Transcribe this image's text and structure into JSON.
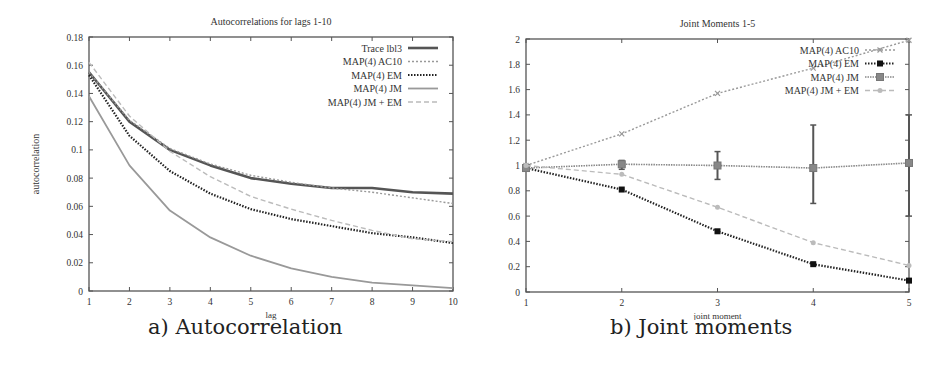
{
  "captions": {
    "left": "a) Autocorrelation",
    "right": "b) Joint moments"
  },
  "chart_data": [
    {
      "type": "line",
      "title": "Autocorrelations for lags 1-10",
      "xlabel": "lag",
      "ylabel": "autocorrelation",
      "x": [
        1,
        2,
        3,
        4,
        5,
        6,
        7,
        8,
        9,
        10
      ],
      "xlim": [
        1,
        10
      ],
      "ylim": [
        0,
        0.18
      ],
      "xticks": [
        1,
        2,
        3,
        4,
        5,
        6,
        7,
        8,
        9,
        10
      ],
      "yticks": [
        0,
        0.02,
        0.04,
        0.06,
        0.08,
        0.1,
        0.12,
        0.14,
        0.16,
        0.18
      ],
      "ytick_labels": [
        "0",
        "0.02",
        "0.04",
        "0.06",
        "0.08",
        "0.1",
        "0.12",
        "0.14",
        "0.16",
        "0.18"
      ],
      "grid": false,
      "legend_position": "top-right",
      "series": [
        {
          "name": "Trace lbl3",
          "values": [
            0.155,
            0.12,
            0.1,
            0.089,
            0.08,
            0.076,
            0.073,
            0.073,
            0.07,
            0.069
          ],
          "color": "#555555",
          "dash": "",
          "width": 2.6
        },
        {
          "name": "MAP(4) AC10",
          "values": [
            0.155,
            0.121,
            0.101,
            0.09,
            0.082,
            0.077,
            0.073,
            0.07,
            0.066,
            0.062
          ],
          "color": "#999999",
          "dash": "2,2",
          "width": 1.4
        },
        {
          "name": "MAP(4) EM",
          "values": [
            0.153,
            0.11,
            0.085,
            0.069,
            0.058,
            0.051,
            0.046,
            0.041,
            0.038,
            0.034
          ],
          "color": "#222222",
          "dash": "1.5,1.5",
          "width": 2.2
        },
        {
          "name": "MAP(4) JM",
          "values": [
            0.138,
            0.089,
            0.057,
            0.038,
            0.025,
            0.016,
            0.01,
            0.006,
            0.004,
            0.002
          ],
          "color": "#999999",
          "dash": "",
          "width": 1.8
        },
        {
          "name": "MAP(4) JM + EM",
          "values": [
            0.162,
            0.124,
            0.099,
            0.081,
            0.067,
            0.058,
            0.05,
            0.043,
            0.037,
            0.035
          ],
          "color": "#bbbbbb",
          "dash": "5,3",
          "width": 1.4
        }
      ]
    },
    {
      "type": "line",
      "title": "Joint Moments 1-5",
      "xlabel": "joint moment",
      "ylabel": "",
      "x": [
        1,
        2,
        3,
        4,
        5
      ],
      "xlim": [
        1,
        5
      ],
      "ylim": [
        0,
        2
      ],
      "xticks": [
        1,
        2,
        3,
        4,
        5
      ],
      "yticks": [
        0,
        0.2,
        0.4,
        0.6,
        0.8,
        1,
        1.2,
        1.4,
        1.6,
        1.8,
        2
      ],
      "ytick_labels": [
        "0",
        "0.2",
        "0.4",
        "0.6",
        "0.8",
        "1",
        "1.2",
        "1.4",
        "1.6",
        "1.8",
        "2"
      ],
      "grid": false,
      "legend_position": "top-right",
      "series": [
        {
          "name": "MAP(4) AC10",
          "values": [
            1.0,
            1.25,
            1.57,
            1.77,
            1.99
          ],
          "color": "#999999",
          "dash": "2,2",
          "width": 1.4,
          "marker": "x"
        },
        {
          "name": "MAP(4) EM",
          "values": [
            0.98,
            0.81,
            0.48,
            0.22,
            0.09
          ],
          "color": "#222222",
          "dash": "1.5,1.5",
          "width": 2.2,
          "marker": "square-filled"
        },
        {
          "name": "MAP(4) JM",
          "values": [
            0.98,
            1.01,
            1.0,
            0.98,
            1.02
          ],
          "color": "#888888",
          "dash": "1.5,1",
          "width": 1.6,
          "marker": "square",
          "error_bars": [
            [
              0.96,
              1.0
            ],
            [
              0.97,
              1.04
            ],
            [
              0.89,
              1.11
            ],
            [
              0.7,
              1.32
            ],
            [
              0.6,
              1.4
            ]
          ]
        },
        {
          "name": "MAP(4) JM + EM",
          "values": [
            1.0,
            0.93,
            0.67,
            0.39,
            0.21
          ],
          "color": "#bbbbbb",
          "dash": "5,3",
          "width": 1.4,
          "marker": "circle"
        }
      ]
    }
  ]
}
